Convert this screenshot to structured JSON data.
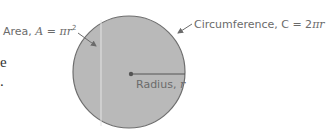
{
  "diagram": {
    "circle": {
      "cx": 129,
      "cy": 72,
      "r": 56,
      "fill": "#b9b9b9",
      "stroke": "#6e6e6e"
    },
    "labels": {
      "area": {
        "prefix": "Area, ",
        "var": "A",
        "eq": " = ",
        "expr": "πr",
        "exp": "2"
      },
      "circumference": {
        "prefix": "Circumference, C = 2",
        "pi": "π",
        "var": "r"
      },
      "radius": {
        "prefix": "Radius, ",
        "var": "r"
      }
    },
    "left_fragments": {
      "line1": "e",
      "line2": "."
    },
    "colors": {
      "text": "#6b6b6b",
      "arrow": "#6b6b6b",
      "dot": "#5a5a5a"
    }
  }
}
